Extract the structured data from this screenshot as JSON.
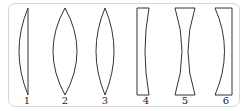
{
  "diagram": {
    "title": "",
    "border_color": "#d8d8d8",
    "stroke_color": "#333333",
    "lenses": [
      {
        "label": "1",
        "type": "plano-convex"
      },
      {
        "label": "2",
        "type": "biconvex"
      },
      {
        "label": "3",
        "type": "biconvex"
      },
      {
        "label": "4",
        "type": "plano-concave"
      },
      {
        "label": "5",
        "type": "biconcave"
      },
      {
        "label": "6",
        "type": "concave-convex meniscus"
      }
    ]
  }
}
